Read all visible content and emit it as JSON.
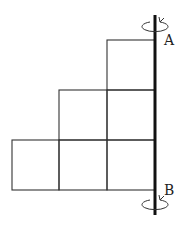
{
  "diagram": {
    "label_top": "A",
    "label_bottom": "B",
    "rows": [
      1,
      2,
      3
    ],
    "line_color": "#333333",
    "axis_color": "#111111"
  }
}
